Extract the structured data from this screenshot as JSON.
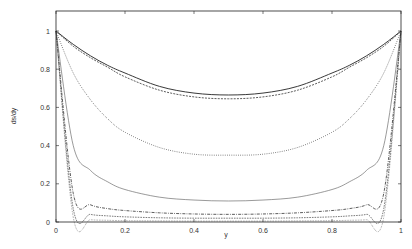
{
  "chart_data": {
    "type": "line",
    "title": "",
    "xlabel": "y",
    "ylabel": "ds/dy",
    "xlim": [
      0,
      1
    ],
    "ylim": [
      0,
      1.1
    ],
    "grid": false,
    "legend": null,
    "x_ticks": [
      "0",
      "0.2",
      "0.4",
      "0.6",
      "0.8",
      "1"
    ],
    "y_ticks": [
      "0",
      "0.2",
      "0.4",
      "0.6",
      "0.8",
      "1"
    ],
    "x": [
      0,
      0.05,
      0.1,
      0.15,
      0.2,
      0.3,
      0.4,
      0.5,
      0.6,
      0.7,
      0.8,
      0.85,
      0.9,
      0.95,
      1
    ],
    "series": [
      {
        "name": "curve-1",
        "style": "solid",
        "values": [
          1.0,
          0.93,
          0.87,
          0.82,
          0.78,
          0.71,
          0.675,
          0.665,
          0.675,
          0.71,
          0.78,
          0.82,
          0.87,
          0.93,
          1.0
        ]
      },
      {
        "name": "curve-2",
        "style": "dashed",
        "values": [
          1.0,
          0.92,
          0.86,
          0.81,
          0.76,
          0.69,
          0.655,
          0.645,
          0.655,
          0.69,
          0.76,
          0.81,
          0.86,
          0.92,
          1.0
        ]
      },
      {
        "name": "curve-3",
        "style": "dotted",
        "values": [
          1.0,
          0.78,
          0.64,
          0.54,
          0.47,
          0.39,
          0.355,
          0.35,
          0.355,
          0.39,
          0.47,
          0.54,
          0.64,
          0.78,
          1.0
        ]
      },
      {
        "name": "curve-4",
        "style": "solid-thin",
        "values": [
          1.0,
          0.4,
          0.27,
          0.21,
          0.17,
          0.13,
          0.115,
          0.11,
          0.115,
          0.13,
          0.17,
          0.21,
          0.27,
          0.4,
          1.0
        ]
      },
      {
        "name": "curve-5",
        "style": "dashdot",
        "values": [
          1.0,
          0.15,
          0.09,
          0.07,
          0.06,
          0.048,
          0.042,
          0.04,
          0.042,
          0.048,
          0.06,
          0.07,
          0.09,
          0.15,
          1.0
        ]
      },
      {
        "name": "curve-6",
        "style": "dashed-fine",
        "values": [
          1.0,
          0.07,
          0.04,
          0.032,
          0.027,
          0.022,
          0.02,
          0.02,
          0.02,
          0.022,
          0.027,
          0.032,
          0.04,
          0.07,
          1.0
        ]
      },
      {
        "name": "curve-7",
        "style": "dotted-fine",
        "values": [
          1.0,
          0.025,
          0.012,
          0.009,
          0.007,
          0.006,
          0.005,
          0.005,
          0.005,
          0.006,
          0.007,
          0.009,
          0.012,
          0.025,
          1.0
        ]
      }
    ]
  }
}
